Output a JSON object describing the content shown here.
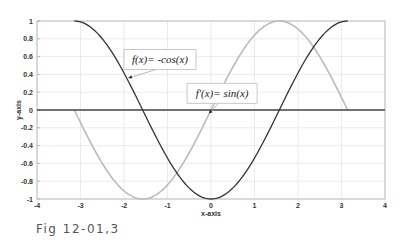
{
  "chart_data": {
    "type": "line",
    "title": "",
    "xlabel": "x-axis",
    "ylabel": "y-axis",
    "xlim": [
      -4,
      4
    ],
    "ylim": [
      -1,
      1
    ],
    "grid": true,
    "xticks": [
      -4,
      -3,
      -2,
      -1,
      0,
      1,
      2,
      3,
      4
    ],
    "yticks": [
      -1,
      -0.8,
      -0.6,
      -0.4,
      -0.2,
      0,
      0.2,
      0.4,
      0.6,
      0.8,
      1
    ],
    "xtick_labels": [
      "-4",
      "-3",
      "-2",
      "-1",
      "0",
      "1",
      "2",
      "3",
      "4"
    ],
    "ytick_labels": [
      "-1",
      "-0.8",
      "-0.6",
      "-0.4",
      "-0.2",
      "0",
      "0.2",
      "0.4",
      "0.6",
      "0.8",
      "1"
    ],
    "series": [
      {
        "name": "f(x)= -cos(x)",
        "function": "-cos(x)",
        "x_range": [
          -3.1416,
          3.1416
        ],
        "color": "#333333",
        "x": [
          -3.1416,
          -2.3562,
          -1.5708,
          -0.7854,
          0,
          0.7854,
          1.5708,
          2.3562,
          3.1416
        ],
        "values": [
          1,
          0.707,
          0,
          -0.707,
          -1,
          -0.707,
          0,
          0.707,
          1
        ]
      },
      {
        "name": "f'(x)= sin(x)",
        "function": "sin(x)",
        "x_range": [
          -3.1416,
          3.1416
        ],
        "color": "#bbbbbb",
        "x": [
          -3.1416,
          -2.3562,
          -1.5708,
          -0.7854,
          0,
          0.7854,
          1.5708,
          2.3562,
          3.1416
        ],
        "values": [
          0,
          -0.707,
          -1,
          -0.707,
          0,
          0.707,
          1,
          0.707,
          0
        ]
      },
      {
        "name": "zero line",
        "function": "0",
        "x_range": [
          -4,
          4
        ],
        "color": "#444444",
        "x": [
          -4,
          4
        ],
        "values": [
          0,
          0
        ]
      }
    ],
    "annotations": [
      {
        "text": "f(x)= -cos(x)",
        "box_x": -2.0,
        "box_y": 0.68,
        "arrow_to_x": -1.9,
        "arrow_to_y": 0.36
      },
      {
        "text": "f'(x)= sin(x)",
        "box_x": -0.55,
        "box_y": 0.3,
        "arrow_to_x": -0.05,
        "arrow_to_y": -0.04
      }
    ]
  },
  "caption": "Fig 12-01,3"
}
